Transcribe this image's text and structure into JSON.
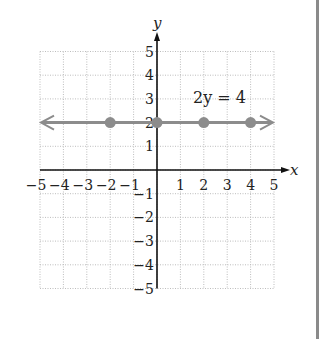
{
  "chart_data": {
    "type": "line",
    "title": "",
    "equation_label": "2y = 4",
    "xlabel": "x",
    "ylabel": "y",
    "xlim": [
      -5,
      5
    ],
    "ylim": [
      -5,
      5
    ],
    "grid": true,
    "x_ticks": [
      -5,
      -4,
      -3,
      -2,
      -1,
      1,
      2,
      3,
      4,
      5
    ],
    "y_ticks": [
      -5,
      -4,
      -3,
      -2,
      -1,
      1,
      2,
      3,
      4,
      5
    ],
    "line": {
      "y": 2,
      "arrows_both_ends": true,
      "color": "#8c8c8c"
    },
    "points": [
      {
        "x": -2,
        "y": 2
      },
      {
        "x": 0,
        "y": 2
      },
      {
        "x": 2,
        "y": 2
      },
      {
        "x": 4,
        "y": 2
      }
    ],
    "point_color": "#8c8c8c"
  }
}
